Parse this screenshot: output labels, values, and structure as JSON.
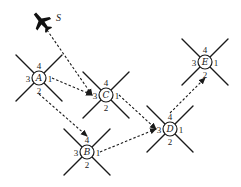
{
  "diagram": {
    "title": "",
    "start": {
      "label": "S",
      "icon": "airplane-icon",
      "x": 42,
      "y": 22
    },
    "ports": [
      "1",
      "2",
      "3",
      "4"
    ],
    "nodes": [
      {
        "id": "A",
        "label": "A",
        "x": 39,
        "y": 78
      },
      {
        "id": "B",
        "label": "B",
        "x": 87,
        "y": 152
      },
      {
        "id": "C",
        "label": "C",
        "x": 106,
        "y": 95
      },
      {
        "id": "D",
        "label": "D",
        "x": 170,
        "y": 129
      },
      {
        "id": "E",
        "label": "E",
        "x": 205,
        "y": 62
      }
    ],
    "edges": [
      {
        "from": "S",
        "to": "C",
        "from_port": "",
        "to_port": "3"
      },
      {
        "from": "A",
        "to": "C",
        "from_port": "1",
        "to_port": "3"
      },
      {
        "from": "A",
        "to": "B",
        "from_port": "2",
        "to_port": "4"
      },
      {
        "from": "C",
        "to": "D",
        "from_port": "1",
        "to_port": "3"
      },
      {
        "from": "B",
        "to": "D",
        "from_port": "1",
        "to_port": "3"
      },
      {
        "from": "D",
        "to": "E",
        "from_port": "4",
        "to_port": "2"
      }
    ],
    "colors": {
      "ink": "#1a1a1a",
      "background": "#ffffff"
    }
  }
}
